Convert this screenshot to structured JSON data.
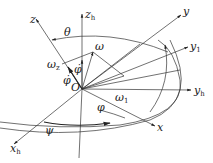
{
  "diagram": {
    "type": "coordinate-frame-rotation",
    "origin_label": "O",
    "axes": [
      {
        "name": "z",
        "label": "z",
        "sub": ""
      },
      {
        "name": "z_h",
        "label": "z",
        "sub": "h"
      },
      {
        "name": "y",
        "label": "y",
        "sub": ""
      },
      {
        "name": "y_1",
        "label": "y",
        "sub": "1"
      },
      {
        "name": "y_h",
        "label": "y",
        "sub": "h"
      },
      {
        "name": "x",
        "label": "x",
        "sub": ""
      },
      {
        "name": "x_h",
        "label": "x",
        "sub": "h"
      }
    ],
    "vectors": [
      {
        "name": "omega",
        "label": "ω",
        "sub": ""
      },
      {
        "name": "omega_z",
        "label": "ω",
        "sub": "z"
      },
      {
        "name": "omega_1",
        "label": "ω",
        "sub": "1"
      }
    ],
    "angles": [
      {
        "name": "theta",
        "label": "θ"
      },
      {
        "name": "phi_dot_upper",
        "label": "φ̇"
      },
      {
        "name": "phi_dot_lower",
        "label": "φ̇"
      },
      {
        "name": "phi",
        "label": "φ"
      },
      {
        "name": "psi",
        "label": "ψ"
      }
    ]
  }
}
